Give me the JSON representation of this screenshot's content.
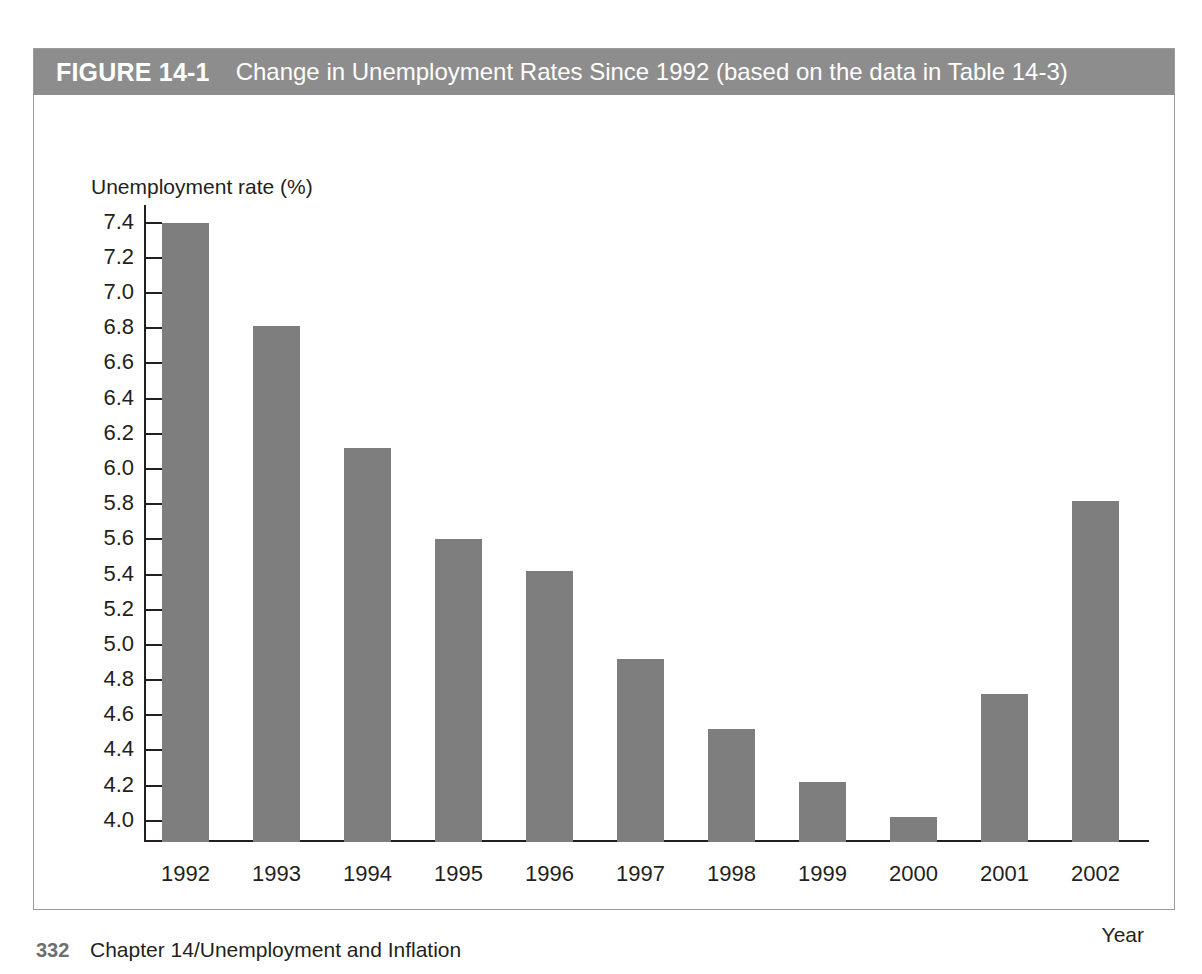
{
  "figure": {
    "number_label": "FIGURE 14-1",
    "title": "Change in Unemployment Rates Since 1992 (based on the data in Table 14-3)",
    "header_bg": "#8d8d8d",
    "header_text_color": "#ffffff",
    "border_color": "#9b9b9b"
  },
  "footer": {
    "page_number": "332",
    "chapter": "Chapter 14/Unemployment and Inflation"
  },
  "chart_data": {
    "type": "bar",
    "title": "Change in Unemployment Rates Since 1992 (based on the data in Table 14-3)",
    "xlabel": "Year",
    "ylabel": "Unemployment rate (%)",
    "categories": [
      "1992",
      "1993",
      "1994",
      "1995",
      "1996",
      "1997",
      "1998",
      "1999",
      "2000",
      "2001",
      "2002"
    ],
    "values": [
      7.4,
      6.81,
      6.12,
      5.6,
      5.42,
      4.92,
      4.52,
      4.22,
      4.02,
      4.72,
      5.82
    ],
    "ytick_labels": [
      "7.4",
      "7.2",
      "7.0",
      "6.8",
      "6.6",
      "6.4",
      "6.2",
      "6.0",
      "5.8",
      "5.6",
      "5.4",
      "5.2",
      "5.0",
      "4.8",
      "4.6",
      "4.4",
      "4.2",
      "4.0"
    ],
    "ytick_values": [
      7.4,
      7.2,
      7.0,
      6.8,
      6.6,
      6.4,
      6.2,
      6.0,
      5.8,
      5.6,
      5.4,
      5.2,
      5.0,
      4.8,
      4.6,
      4.4,
      4.2,
      4.0
    ],
    "ylim": [
      3.88,
      7.5
    ],
    "axis_break": true,
    "grid": false,
    "legend": "none",
    "bar_color": "#7e7e7e",
    "axis_color": "#231f20"
  }
}
